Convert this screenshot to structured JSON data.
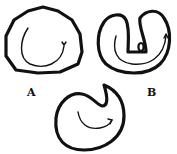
{
  "figure": {
    "shapes": [
      {
        "id": "A",
        "label": "A",
        "description": "rounded closed outline with an inner curved arrow"
      },
      {
        "id": "B",
        "label": "B",
        "description": "horseshoe/U-shaped outline with inner curved arrow and small oval"
      },
      {
        "id": "C",
        "label": "",
        "description": "crescent-like outline with notch at top and inner curved arrow"
      }
    ]
  }
}
